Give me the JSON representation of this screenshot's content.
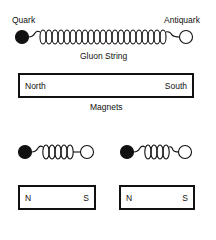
{
  "top_pair": {
    "quark_label": "Quark",
    "antiquark_label": "Antiquark",
    "string_label": "Gluon String"
  },
  "big_magnet": {
    "left_pole": "North",
    "right_pole": "South",
    "caption": "Magnets"
  },
  "small_magnets": [
    {
      "left_pole": "N",
      "right_pole": "S"
    },
    {
      "left_pole": "N",
      "right_pole": "S"
    }
  ],
  "colors": {
    "ink": "#111111",
    "background": "#ffffff"
  }
}
